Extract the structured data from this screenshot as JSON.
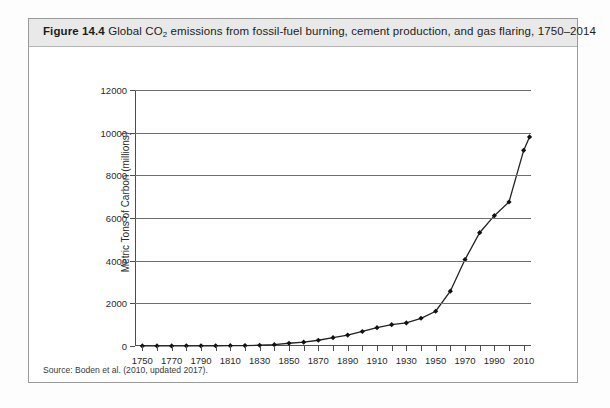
{
  "figure": {
    "number": "Figure 14.4",
    "caption_part1": "Global CO",
    "caption_sub": "2",
    "caption_part2": " emissions from fossil-fuel burning, cement production, and gas flaring, 1750–2014",
    "source": "Source:  Boden et al. (2010, updated 2017)."
  },
  "chart_data": {
    "type": "line",
    "title": "Global CO2 emissions from fossil-fuel burning, cement production, and gas flaring, 1750–2014",
    "xlabel": "",
    "ylabel": "Metric Tons of Carbon (millions)",
    "xlim": [
      1745,
      2015
    ],
    "ylim": [
      0,
      12000
    ],
    "grid": true,
    "legend": "none",
    "marker": "diamond",
    "line_color": "#222222",
    "marker_color": "#111111",
    "grid_color": "#6f6f6f",
    "ytick_labels": [
      "0",
      "2000",
      "4000",
      "6000",
      "8000",
      "10000",
      "12000"
    ],
    "ytick_values": [
      0,
      2000,
      4000,
      6000,
      8000,
      10000,
      12000
    ],
    "xtick_labels": [
      "1750",
      "1770",
      "1790",
      "1810",
      "1830",
      "1850",
      "1870",
      "1890",
      "1910",
      "1930",
      "1950",
      "1970",
      "1990",
      "2010"
    ],
    "xtick_values": [
      1750,
      1770,
      1790,
      1810,
      1830,
      1850,
      1870,
      1890,
      1910,
      1930,
      1950,
      1970,
      1990,
      2010
    ],
    "xminor_values": [
      1760,
      1780,
      1800,
      1820,
      1840,
      1860,
      1880,
      1900,
      1920,
      1940,
      1960,
      1980,
      2000
    ],
    "x": [
      1750,
      1760,
      1770,
      1780,
      1790,
      1800,
      1810,
      1820,
      1830,
      1840,
      1850,
      1860,
      1870,
      1880,
      1890,
      1900,
      1910,
      1920,
      1930,
      1940,
      1950,
      1960,
      1970,
      1980,
      1990,
      2000,
      2010,
      2014
    ],
    "values": [
      3,
      4,
      5,
      7,
      9,
      11,
      16,
      22,
      36,
      60,
      130,
      180,
      270,
      390,
      510,
      680,
      860,
      1000,
      1080,
      1300,
      1630,
      2570,
      4050,
      5310,
      6110,
      6750,
      9170,
      9800
    ],
    "series": [
      {
        "name": "Global CO2 emissions",
        "values": [
          3,
          4,
          5,
          7,
          9,
          11,
          16,
          22,
          36,
          60,
          130,
          180,
          270,
          390,
          510,
          680,
          860,
          1000,
          1080,
          1300,
          1630,
          2570,
          4050,
          5310,
          6110,
          6750,
          9170,
          9800
        ]
      }
    ]
  }
}
